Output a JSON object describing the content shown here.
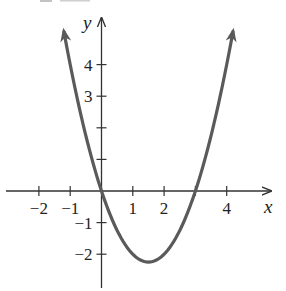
{
  "chart_data": {
    "type": "line",
    "title": "",
    "function": "y = x^2 - 3x",
    "xlabel": "x",
    "ylabel": "y",
    "xlim": [
      -2.95,
      5.3
    ],
    "ylim": [
      -3.05,
      5.4
    ],
    "x_ticks": [
      -2,
      -1,
      0,
      1,
      2,
      3,
      4
    ],
    "x_tick_labels": [
      {
        "value": -2,
        "label": "−2"
      },
      {
        "value": -1,
        "label": "−1"
      },
      {
        "value": 1,
        "label": "1"
      },
      {
        "value": 2,
        "label": "2"
      },
      {
        "value": 4,
        "label": "4"
      }
    ],
    "y_ticks": [
      -2,
      -1,
      1,
      2,
      3,
      4
    ],
    "y_tick_labels": [
      {
        "value": 4,
        "label": "4"
      },
      {
        "value": 3,
        "label": "3"
      },
      {
        "value": -1,
        "label": "−1"
      },
      {
        "value": -2,
        "label": "−2"
      }
    ],
    "series": [
      {
        "name": "parabola",
        "color": "#5a5a5a",
        "x": [
          -1.19,
          -1,
          -0.5,
          0,
          0.5,
          1,
          1.5,
          2,
          2.5,
          3,
          3.5,
          4,
          4.19
        ],
        "y": [
          5.0,
          4,
          1.75,
          0,
          -1.25,
          -2,
          -2.25,
          -2,
          -1.25,
          0,
          1.75,
          4,
          5.0
        ]
      }
    ],
    "key_points": {
      "x_intercepts": [
        0,
        3
      ],
      "vertex": [
        1.5,
        -2.25
      ]
    },
    "grid": false,
    "legend": null,
    "arrows_on_curve_ends": true
  },
  "colors": {
    "axis": "#333333",
    "curve": "#5a5a5a",
    "background": "#ffffff"
  }
}
